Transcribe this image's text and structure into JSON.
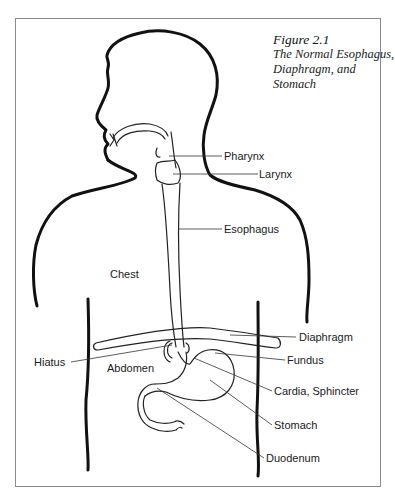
{
  "figure": {
    "number": "Figure 2.1",
    "title_lines": [
      "The Normal Esophagus,",
      "Diaphragm, and",
      "Stomach"
    ]
  },
  "labels": {
    "pharynx": "Pharynx",
    "larynx": "Larynx",
    "esophagus": "Esophagus",
    "chest": "Chest",
    "diaphragm": "Diaphragm",
    "fundus": "Fundus",
    "hiatus": "Hiatus",
    "abdomen": "Abdomen",
    "cardia_sphincter": "Cardia, Sphincter",
    "stomach": "Stomach",
    "duodenum": "Duodenum"
  },
  "colors": {
    "outline": "#111111",
    "organ_line": "#222222",
    "leader_line": "#333333",
    "frame": "#8a8a8a"
  }
}
